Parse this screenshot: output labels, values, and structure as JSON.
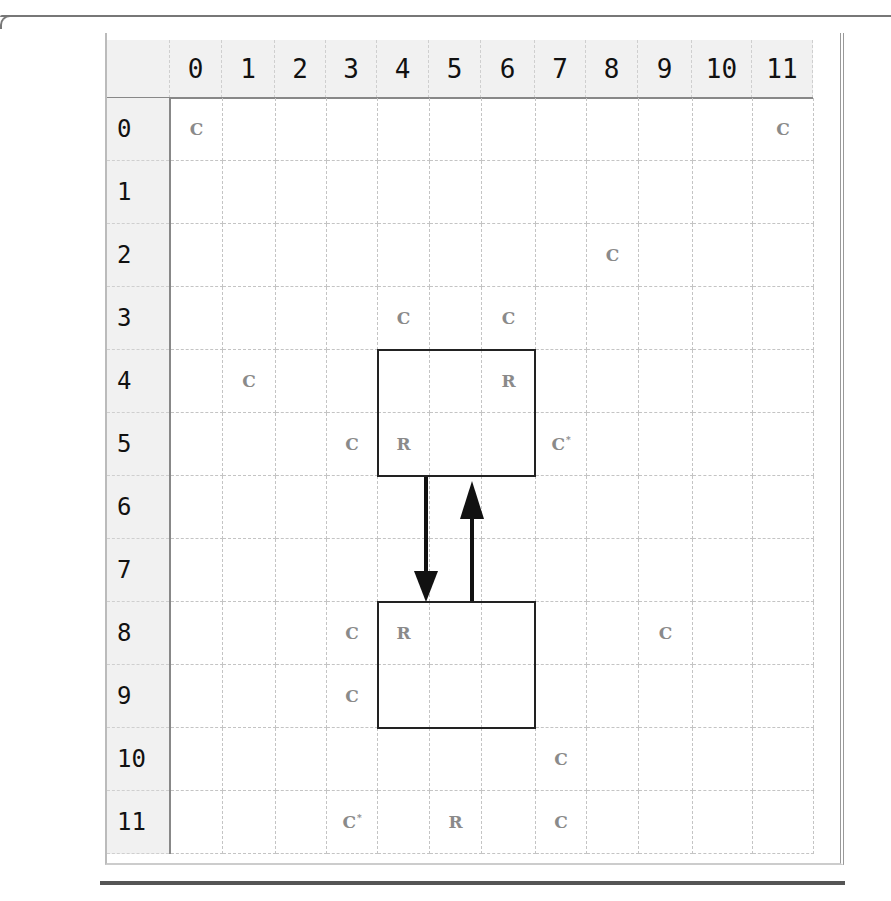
{
  "grid": {
    "column_headers": [
      "0",
      "1",
      "2",
      "3",
      "4",
      "5",
      "6",
      "7",
      "8",
      "9",
      "10",
      "11"
    ],
    "row_headers": [
      "0",
      "1",
      "2",
      "3",
      "4",
      "5",
      "6",
      "7",
      "8",
      "9",
      "10",
      "11"
    ],
    "cells": [
      {
        "row": 0,
        "col": 0,
        "label": "C",
        "mark": ""
      },
      {
        "row": 0,
        "col": 11,
        "label": "C",
        "mark": ""
      },
      {
        "row": 2,
        "col": 8,
        "label": "C",
        "mark": ""
      },
      {
        "row": 3,
        "col": 4,
        "label": "C",
        "mark": ""
      },
      {
        "row": 3,
        "col": 6,
        "label": "C",
        "mark": ""
      },
      {
        "row": 4,
        "col": 1,
        "label": "C",
        "mark": ""
      },
      {
        "row": 4,
        "col": 6,
        "label": "R",
        "mark": ""
      },
      {
        "row": 5,
        "col": 3,
        "label": "C",
        "mark": ""
      },
      {
        "row": 5,
        "col": 4,
        "label": "R",
        "mark": ""
      },
      {
        "row": 5,
        "col": 7,
        "label": "C",
        "mark": "*"
      },
      {
        "row": 8,
        "col": 3,
        "label": "C",
        "mark": ""
      },
      {
        "row": 8,
        "col": 4,
        "label": "R",
        "mark": ""
      },
      {
        "row": 8,
        "col": 9,
        "label": "C",
        "mark": ""
      },
      {
        "row": 9,
        "col": 3,
        "label": "C",
        "mark": ""
      },
      {
        "row": 10,
        "col": 7,
        "label": "C",
        "mark": ""
      },
      {
        "row": 11,
        "col": 3,
        "label": "C",
        "mark": "*"
      },
      {
        "row": 11,
        "col": 5,
        "label": "R",
        "mark": ""
      },
      {
        "row": 11,
        "col": 7,
        "label": "C",
        "mark": ""
      }
    ],
    "highlight_boxes": [
      {
        "name": "upper-region",
        "row_start": 4,
        "row_end": 5,
        "col_start": 4,
        "col_end": 6
      },
      {
        "name": "lower-region",
        "row_start": 8,
        "row_end": 9,
        "col_start": 4,
        "col_end": 6
      }
    ],
    "arrows": [
      {
        "name": "arrow-down",
        "from": "upper-region",
        "to": "lower-region",
        "direction": "down"
      },
      {
        "name": "arrow-up",
        "from": "lower-region",
        "to": "upper-region",
        "direction": "up"
      }
    ]
  },
  "colors": {
    "header_bg": "#f1f1f1",
    "grid_line": "#c4c4c4",
    "cell_text": "#8a8a8a",
    "box_border": "#222222"
  }
}
